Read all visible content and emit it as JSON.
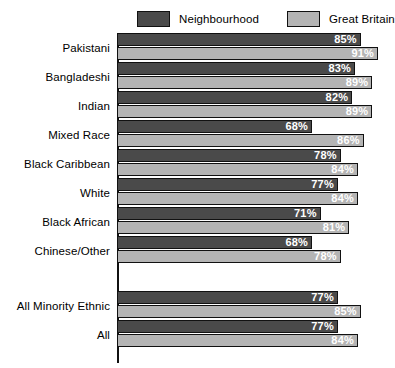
{
  "legend": {
    "items": [
      {
        "label": "Neighbourhood",
        "color": "#4a4a4a",
        "icon": "legend-swatch-icon"
      },
      {
        "label": "Great Britain",
        "color": "#b4b4b4",
        "icon": "legend-swatch-icon"
      }
    ]
  },
  "chart_data": {
    "type": "bar",
    "orientation": "horizontal",
    "title": "",
    "xlabel": "",
    "ylabel": "",
    "xlim": [
      0,
      100
    ],
    "grid": false,
    "legend_position": "top",
    "value_suffix": "%",
    "categories": [
      "Pakistani",
      "Bangladeshi",
      "Indian",
      "Mixed Race",
      "Black Caribbean",
      "White",
      "Black African",
      "Chinese/Other",
      "All Minority Ethnic",
      "All"
    ],
    "gap_after_category": "Chinese/Other",
    "series": [
      {
        "name": "Neighbourhood",
        "color": "#4a4a4a",
        "values": [
          85,
          83,
          82,
          68,
          78,
          77,
          71,
          68,
          77,
          77
        ],
        "labels": [
          "85%",
          "83%",
          "82%",
          "68%",
          "78%",
          "77%",
          "71%",
          "68%",
          "77%",
          "77%"
        ]
      },
      {
        "name": "Great Britain",
        "color": "#b4b4b4",
        "values": [
          91,
          89,
          89,
          86,
          84,
          84,
          81,
          78,
          85,
          84
        ],
        "labels": [
          "91%",
          "89%",
          "89%",
          "86%",
          "84%",
          "84%",
          "81%",
          "78%",
          "85%",
          "84%"
        ]
      }
    ]
  }
}
